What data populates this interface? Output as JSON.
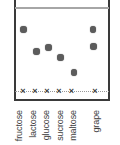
{
  "chart_data": {
    "type": "scatter",
    "variant": "paper-chromatography-plate",
    "title": "",
    "xlabel": "",
    "ylabel": "",
    "categories": [
      "fructose",
      "lactose",
      "glucose",
      "sucrose",
      "maltose",
      "grape"
    ],
    "origin_marker": "×",
    "origin_line_y_px": 91,
    "solvent_front_y_px": 7.5,
    "plate_px": {
      "left": 14,
      "right": 110,
      "bottom": 101,
      "top_cropped": true
    },
    "lanes": [
      {
        "label": "fructose",
        "origin_x_px": 23,
        "label_x_px": 19,
        "spots": [
          {
            "x_px": 23.7,
            "y_px": 29.5,
            "rf": 0.74
          }
        ]
      },
      {
        "label": "lactose",
        "origin_x_px": 35,
        "label_x_px": 33,
        "spots": [
          {
            "x_px": 36.7,
            "y_px": 51.3,
            "rf": 0.48
          }
        ]
      },
      {
        "label": "glucose",
        "origin_x_px": 47,
        "label_x_px": 46,
        "spots": [
          {
            "x_px": 48.7,
            "y_px": 47.3,
            "rf": 0.52
          }
        ]
      },
      {
        "label": "sucrose",
        "origin_x_px": 59,
        "label_x_px": 60,
        "spots": [
          {
            "x_px": 60.7,
            "y_px": 57.3,
            "rf": 0.4
          }
        ]
      },
      {
        "label": "maltose",
        "origin_x_px": 71.5,
        "label_x_px": 73,
        "spots": [
          {
            "x_px": 74.0,
            "y_px": 72.7,
            "rf": 0.22
          }
        ]
      },
      {
        "label": "grape",
        "origin_x_px": 95,
        "label_x_px": 96,
        "spots": [
          {
            "x_px": 93.0,
            "y_px": 29.3,
            "rf": 0.74
          },
          {
            "x_px": 93.5,
            "y_px": 46.7,
            "rf": 0.53
          }
        ]
      }
    ],
    "colors": {
      "background": "#ffffff",
      "plate_border": "#3a3a3a",
      "solvent_front": "#a6a6a6",
      "origin_line": "#999999",
      "origin_marker": "#3f3f3f",
      "spot": "#5c5c5c",
      "label": "#3e3e3e"
    }
  }
}
